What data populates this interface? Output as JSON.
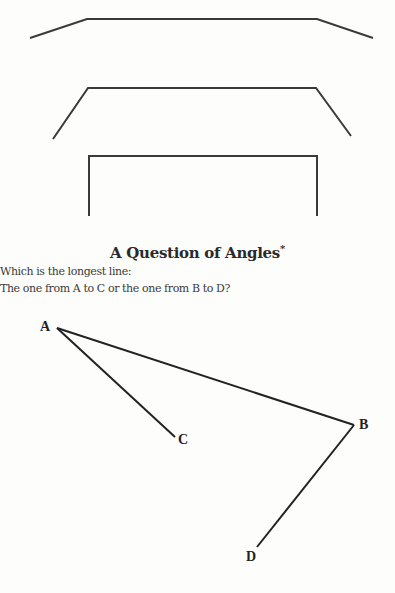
{
  "title": "A Question of Angles",
  "title_mark": "*",
  "question": {
    "line1": "Which is the longest line:",
    "line2": "The one from A to C or the one from B to D?"
  },
  "labels": {
    "a": "A",
    "b": "B",
    "c": "C",
    "d": "D"
  },
  "colors": {
    "line": "#333333",
    "background": "#fdfdfc"
  }
}
